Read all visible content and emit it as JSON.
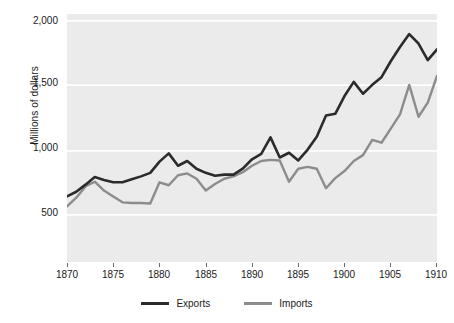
{
  "chart_data": {
    "type": "line",
    "title": "",
    "subtitle": "",
    "xlabel": "",
    "ylabel": "Millions of dollars",
    "xlim": [
      1870,
      1910
    ],
    "ylim": [
      0,
      2100
    ],
    "grid": true,
    "grid_axis": "y",
    "legend_position": "bottom",
    "plot_background": "#ebebeb",
    "x_tick_labels": [
      "1870",
      "1875",
      "1880",
      "1885",
      "1890",
      "1895",
      "1900",
      "1905",
      "1910"
    ],
    "x_ticks": [
      1870,
      1875,
      1880,
      1885,
      1890,
      1895,
      1900,
      1905,
      1910
    ],
    "y_tick_labels": [
      "500",
      "1,000",
      "1,500",
      "2,000"
    ],
    "y_ticks": [
      500,
      1000,
      1500,
      2000
    ],
    "x": [
      1870,
      1871,
      1872,
      1873,
      1874,
      1875,
      1876,
      1877,
      1878,
      1879,
      1880,
      1881,
      1882,
      1883,
      1884,
      1885,
      1886,
      1887,
      1888,
      1889,
      1890,
      1891,
      1892,
      1893,
      1894,
      1895,
      1896,
      1897,
      1898,
      1899,
      1900,
      1901,
      1902,
      1903,
      1904,
      1905,
      1906,
      1907,
      1908,
      1909,
      1910
    ],
    "series": [
      {
        "name": "Exports",
        "color": "#2b2b2b",
        "values": [
          555,
          595,
          655,
          720,
          695,
          675,
          675,
          700,
          725,
          755,
          850,
          920,
          815,
          855,
          790,
          755,
          730,
          740,
          740,
          790,
          870,
          915,
          1055,
          885,
          925,
          860,
          950,
          1060,
          1240,
          1255,
          1405,
          1525,
          1425,
          1500,
          1565,
          1700,
          1820,
          1930,
          1850,
          1710,
          1800
        ]
      },
      {
        "name": "Imports",
        "color": "#8c8c8c",
        "values": [
          470,
          545,
          640,
          680,
          605,
          555,
          505,
          500,
          500,
          495,
          675,
          650,
          735,
          750,
          705,
          605,
          660,
          705,
          725,
          760,
          815,
          855,
          865,
          860,
          680,
          790,
          805,
          790,
          625,
          710,
          770,
          855,
          905,
          1035,
          1010,
          1130,
          1250,
          1500,
          1230,
          1350,
          1575
        ]
      }
    ]
  }
}
